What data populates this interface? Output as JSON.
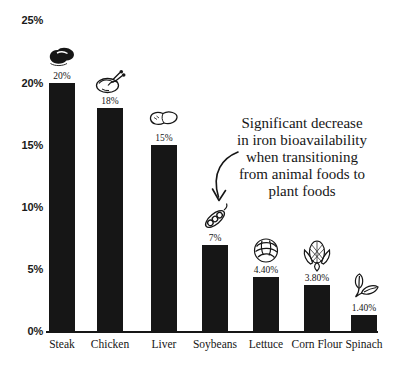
{
  "page": {
    "background": "#ffffff",
    "text_color": "#161616"
  },
  "chart_data": {
    "type": "bar",
    "title": "",
    "xlabel": "",
    "ylabel": "",
    "categories": [
      "Steak",
      "Chicken",
      "Liver",
      "Soybeans",
      "Lettuce",
      "Corn Flour",
      "Spinach"
    ],
    "values": [
      20,
      18,
      15,
      7,
      4.4,
      3.8,
      1.4
    ],
    "value_labels": [
      "20%",
      "18%",
      "15%",
      "7%",
      "4.40%",
      "3.80%",
      "1.40%"
    ],
    "icons": [
      "steak-icon",
      "chicken-icon",
      "liver-icon",
      "soybean-pod-icon",
      "lettuce-icon",
      "corn-cob-icon",
      "spinach-leaves-icon"
    ],
    "yticks": [
      "0%",
      "5%",
      "10%",
      "15%",
      "20%",
      "25%"
    ],
    "ylim": [
      0,
      25
    ],
    "grid": false,
    "legend_position": "none",
    "bar_color": "#161616",
    "annotation": {
      "lines": [
        "Significant decrease",
        "in iron bioavailability",
        "when transitioning",
        "from animal foods to",
        "plant foods"
      ],
      "arrow_target_category": "Soybeans"
    }
  }
}
